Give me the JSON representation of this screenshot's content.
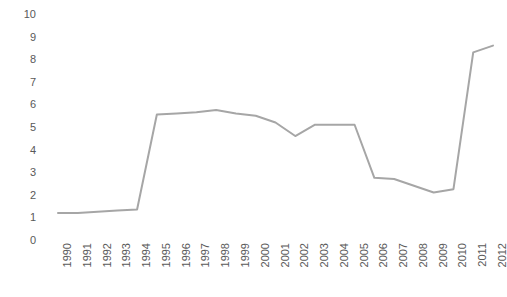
{
  "chart_data": {
    "type": "line",
    "title": "",
    "subtitle": "",
    "xlabel": "",
    "ylabel": "",
    "categories": [
      "1990",
      "1991",
      "1992",
      "1993",
      "1994",
      "1995",
      "1996",
      "1997",
      "1998",
      "1999",
      "2000",
      "2001",
      "2002",
      "2003",
      "2004",
      "2005",
      "2006",
      "2007",
      "2008",
      "2009",
      "2010",
      "2011",
      "2012"
    ],
    "values": [
      1.2,
      1.2,
      1.25,
      1.3,
      1.35,
      5.55,
      5.6,
      5.65,
      5.75,
      5.6,
      5.5,
      5.2,
      4.6,
      5.1,
      5.1,
      5.1,
      2.75,
      2.7,
      2.4,
      2.1,
      2.25,
      8.3,
      8.6
    ],
    "series": [
      {
        "name": "Series 1",
        "color": "#a6a6a6",
        "values": [
          1.2,
          1.2,
          1.25,
          1.3,
          1.35,
          5.55,
          5.6,
          5.65,
          5.75,
          5.6,
          5.5,
          5.2,
          4.6,
          5.1,
          5.1,
          5.1,
          2.75,
          2.7,
          2.4,
          2.1,
          2.25,
          8.3,
          8.6
        ]
      }
    ],
    "ylim": [
      0,
      10
    ],
    "y_ticks": [
      0,
      1,
      2,
      3,
      4,
      5,
      6,
      7,
      8,
      9,
      10
    ],
    "y_tick_labels": [
      "0",
      "1",
      "2",
      "3",
      "4",
      "5",
      "6",
      "7",
      "8",
      "9",
      "10"
    ],
    "grid": false,
    "legend": false,
    "legend_position": "none",
    "axis_line": false,
    "markers": false,
    "line_width": 2,
    "line_color": "#a6a6a6",
    "tick_label_color": "#595959",
    "background_color": "#ffffff",
    "x_tick_rotation": -90
  }
}
